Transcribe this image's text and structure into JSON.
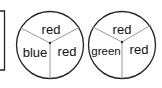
{
  "diagram": {
    "left_box": {
      "partial": true
    },
    "spinners": [
      {
        "sectors": [
          {
            "label": "red",
            "position": "top"
          },
          {
            "label": "blue",
            "position": "left"
          },
          {
            "label": "red",
            "position": "right"
          }
        ]
      },
      {
        "sectors": [
          {
            "label": "red",
            "position": "top"
          },
          {
            "label": "green",
            "position": "left"
          },
          {
            "label": "red",
            "position": "right"
          }
        ]
      }
    ],
    "colors": {
      "stroke": "#222222",
      "divider": "#999999",
      "text": "#111111"
    }
  }
}
